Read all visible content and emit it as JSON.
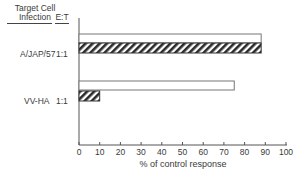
{
  "chart_data": {
    "type": "bar",
    "orientation": "horizontal",
    "title": "",
    "xlabel": "% of control response",
    "ylabel": "",
    "xlim": [
      0,
      100
    ],
    "xticks": [
      0,
      10,
      20,
      30,
      40,
      50,
      60,
      70,
      80,
      90,
      100
    ],
    "grid": false,
    "row_header": {
      "col1": "Target Cell Infection",
      "col2": "E:T"
    },
    "categories": [
      {
        "infection": "A/JAP/57",
        "et": "1:1"
      },
      {
        "infection": "VV-HA",
        "et": "1:1"
      }
    ],
    "series": [
      {
        "name": "open bar",
        "pattern": "open",
        "values": [
          88,
          75
        ]
      },
      {
        "name": "hatched bar",
        "pattern": "hatched",
        "values": [
          88,
          10
        ]
      }
    ]
  },
  "header": {
    "target_line1": "Target Cell",
    "target_line2": "Infection",
    "et": "E:T"
  },
  "rows": [
    {
      "label": "A/JAP/57",
      "ratio": "1:1"
    },
    {
      "label": "VV-HA",
      "ratio": "1:1"
    }
  ],
  "axis": {
    "ticks": [
      "0",
      "10",
      "20",
      "30",
      "40",
      "50",
      "60",
      "70",
      "80",
      "90",
      "100"
    ],
    "title": "% of control response"
  }
}
